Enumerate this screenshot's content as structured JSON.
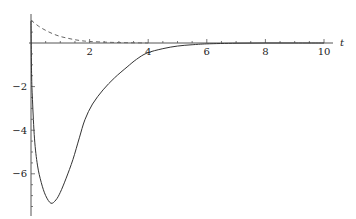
{
  "chart_data": {
    "type": "line",
    "title": "",
    "xlabel": "t",
    "ylabel": "",
    "xlim": [
      0,
      10
    ],
    "ylim": [
      -7.8,
      1.3
    ],
    "grid": false,
    "legend": null,
    "x_ticks": [
      2,
      4,
      6,
      8,
      10
    ],
    "x_tick_labels": [
      "2",
      "4",
      "6",
      "8",
      "10"
    ],
    "y_ticks": [
      -2,
      -4,
      -6
    ],
    "y_tick_labels": [
      "-2",
      "-4",
      "-6"
    ],
    "x_minor_step": 0.5,
    "y_minor_step": 0.5,
    "series": [
      {
        "name": "solid",
        "style": "solid",
        "color": "#333333",
        "x": [
          0,
          0.02,
          0.05,
          0.12,
          0.22,
          0.35,
          0.5,
          0.68,
          0.85,
          1.0,
          1.2,
          1.43,
          1.65,
          1.84,
          2.1,
          2.46,
          2.85,
          3.28,
          3.6,
          3.96,
          4.5,
          5.0,
          5.5,
          6.0,
          7.0,
          8.0,
          9.0,
          10.0
        ],
        "y": [
          1.0,
          -1.4,
          -2.6,
          -4.4,
          -5.6,
          -6.4,
          -7.0,
          -7.35,
          -7.2,
          -6.85,
          -6.2,
          -5.35,
          -4.35,
          -3.52,
          -2.8,
          -2.15,
          -1.6,
          -1.1,
          -0.75,
          -0.46,
          -0.26,
          -0.14,
          -0.08,
          -0.04,
          -0.01,
          0.0,
          0.0,
          0.0
        ]
      },
      {
        "name": "dashed",
        "style": "dashed",
        "color": "#666666",
        "x": [
          0,
          0.25,
          0.5,
          0.75,
          1.0,
          1.25,
          1.5,
          1.75,
          2.0,
          2.5,
          3.0,
          3.5,
          4.0
        ],
        "y": [
          1.05,
          0.78,
          0.58,
          0.42,
          0.3,
          0.22,
          0.15,
          0.1,
          0.07,
          0.04,
          0.02,
          0.01,
          0.0
        ]
      }
    ]
  },
  "layout": {
    "origin_px": [
      31,
      43
    ],
    "px_per_x": 29.3,
    "px_per_y": 21.8,
    "x_axis_end_px": 333,
    "y_axis_top_px": 14,
    "y_axis_bottom_px": 216
  }
}
